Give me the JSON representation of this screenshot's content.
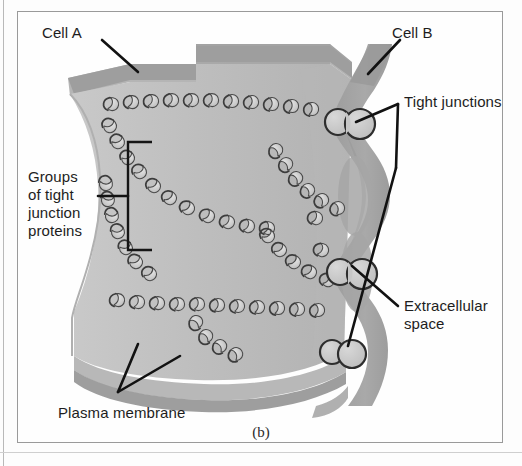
{
  "figure": {
    "caption": "(b)",
    "background_color": "#fdfdfd",
    "frame_color": "#9a9a9a"
  },
  "labels": {
    "cell_a": "Cell A",
    "cell_b": "Cell B",
    "tight_junctions": "Tight junctions",
    "groups_of_proteins": "Groups\nof tight\njunction\nproteins",
    "extracellular_space": "Extracellular\nspace",
    "plasma_membrane": "Plasma membrane"
  },
  "colors": {
    "membrane_face": "#bdbdbd",
    "membrane_face_light": "#cccccc",
    "membrane_edge_dark": "#9a9a9a",
    "membrane_top_band": "#a3a3a3",
    "cell_b_strip": "#a0a0a0",
    "extracellular_fill": "#a8a8a8",
    "protein_outline": "#3a3a3a",
    "protein_fill": "#cfcfcf",
    "junction_fill": "#c6c6c6",
    "leader_line": "#1a1a1a",
    "text": "#1d1d1d"
  },
  "diagram_elements": {
    "cell_a_membrane": "large gray membrane sheet occupying left and center, shown in 3D perspective with a darker top edge band",
    "cell_b_membrane": "gray vertical strip at right that pinches against cell A at the junction points",
    "protein_strands": "rows of teardrop-shaped transmembrane protein particles arranged in branching horizontal and diagonal strands across the membrane face",
    "tight_junction_count": 3,
    "tight_junction_shape": "pairs of fused circles where the two plasma membranes make direct contact",
    "extracellular_space_shape": "lens-shaped gray gaps between successive tight junction contact points"
  },
  "pointers": {
    "cell_a": "diagonal leader from label down-right onto the top membrane edge",
    "cell_b": "diagonal leader from label down-left onto the right membrane strip",
    "tight_junctions": "two leaders branching from a single vertex to the upper and lower junction circles",
    "groups_of_proteins": "horizontal leader to a square bracket enclosing one strand group",
    "extracellular_space": "diagonal leader up-left to the lens-shaped gap",
    "plasma_membrane": "two leaders in a V shape pointing up to the membrane's cut edge"
  }
}
